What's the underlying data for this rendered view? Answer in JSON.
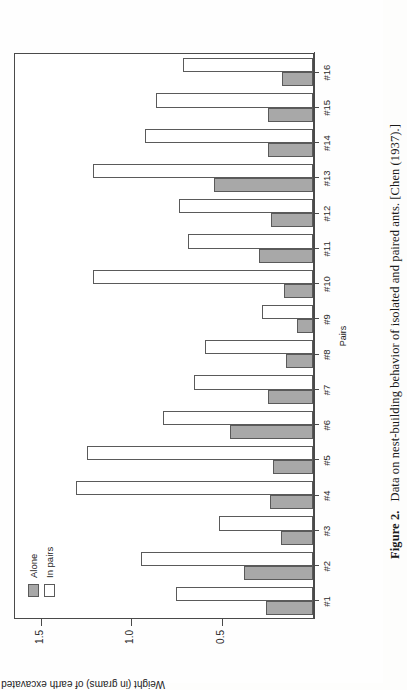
{
  "figure": {
    "number_label": "Figure 2.",
    "caption": "Data on nest-building behavior of isolated and paired ants. [Chen (1937).]"
  },
  "chart_data": {
    "type": "bar",
    "title": "",
    "xlabel": "Pairs",
    "ylabel": "Weight (in grams) of earth excavated",
    "orientation": "vertical",
    "grid": false,
    "legend_position": "top-left",
    "ylim": [
      0,
      1.65
    ],
    "yticks": [
      0.5,
      1.0,
      1.5
    ],
    "ytick_labels": [
      "0.5",
      "1.0",
      "1.5"
    ],
    "categories": [
      "#1",
      "#2",
      "#3",
      "#4",
      "#5",
      "#6",
      "#7",
      "#8",
      "#9",
      "#10",
      "#11",
      "#12",
      "#13",
      "#14",
      "#15",
      "#16"
    ],
    "series": [
      {
        "name": "Alone",
        "color": "#a8a8a8",
        "values": [
          0.26,
          0.38,
          0.18,
          0.24,
          0.22,
          0.46,
          0.25,
          0.15,
          0.09,
          0.16,
          0.3,
          0.23,
          0.55,
          0.25,
          0.25,
          0.17
        ]
      },
      {
        "name": "In pairs",
        "color": "#ffffff",
        "values": [
          0.76,
          0.95,
          0.52,
          1.31,
          1.25,
          0.83,
          0.66,
          0.6,
          0.28,
          1.22,
          0.69,
          0.74,
          1.22,
          0.93,
          0.87,
          0.72
        ]
      }
    ]
  },
  "legend": {
    "items": [
      {
        "label": "Alone",
        "swatch": "alone"
      },
      {
        "label": "In pairs",
        "swatch": "pairs"
      }
    ]
  }
}
